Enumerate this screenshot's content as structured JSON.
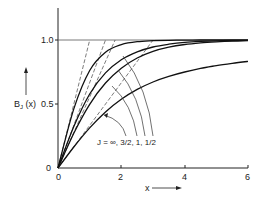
{
  "chart_data": {
    "type": "line",
    "title": "",
    "xlabel": "x",
    "ylabel": "B_J (x)",
    "xlim": [
      0,
      6
    ],
    "ylim": [
      0,
      1.0
    ],
    "x_ticks": [
      "0",
      "2",
      "4",
      "6"
    ],
    "y_ticks": [
      "0",
      "0.5",
      "1.0"
    ],
    "grid": false,
    "reference_line": {
      "y": 1.0,
      "label": "1.0"
    },
    "annotation": "J = ∞, 3/2, 1, 1/2",
    "x": [
      0,
      0.5,
      1,
      1.5,
      2,
      2.5,
      3,
      3.5,
      4,
      4.5,
      5,
      5.5,
      6
    ],
    "series": [
      {
        "name": "J = 1/2",
        "style": "solid",
        "values": [
          0,
          0.462,
          0.762,
          0.905,
          0.964,
          0.987,
          0.995,
          0.998,
          0.999,
          1.0,
          1.0,
          1.0,
          1.0
        ]
      },
      {
        "name": "J = 1",
        "style": "solid",
        "values": [
          0,
          0.324,
          0.578,
          0.743,
          0.845,
          0.907,
          0.945,
          0.967,
          0.981,
          0.989,
          0.993,
          0.996,
          0.998
        ]
      },
      {
        "name": "J = 3/2",
        "style": "solid",
        "values": [
          0,
          0.272,
          0.498,
          0.664,
          0.78,
          0.859,
          0.911,
          0.944,
          0.965,
          0.978,
          0.986,
          0.991,
          0.995
        ]
      },
      {
        "name": "J = ∞",
        "style": "solid",
        "values": [
          0,
          0.164,
          0.313,
          0.438,
          0.537,
          0.614,
          0.672,
          0.716,
          0.75,
          0.778,
          0.8,
          0.818,
          0.833
        ]
      },
      {
        "name": "tangent J = 1/2",
        "style": "dashed",
        "slope": 1.0
      },
      {
        "name": "tangent J = 1",
        "style": "dashed",
        "slope": 0.667
      },
      {
        "name": "tangent J = 3/2",
        "style": "dashed",
        "slope": 0.556
      },
      {
        "name": "tangent J = ∞",
        "style": "dashed",
        "slope": 0.333
      }
    ]
  },
  "labels": {
    "ylabel_text": "B",
    "ylabel_sub": "J",
    "ylabel_rest": " (x) ",
    "y_mid": "0.5",
    "y_top": "1.0",
    "y_zero": "0",
    "x_zero": "0",
    "x_2": "2",
    "x_4": "4",
    "x_6": "6",
    "xlabel": "x",
    "annotation": "J = ∞, 3/2, 1, 1/2"
  }
}
